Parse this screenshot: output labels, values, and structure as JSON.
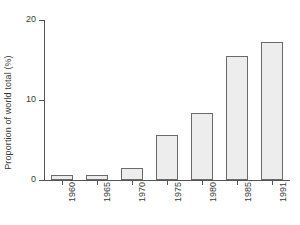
{
  "chart_data": {
    "type": "bar",
    "title": "",
    "subtitle": "",
    "xlabel": "",
    "ylabel": "Proportion of world total (%)",
    "categories": [
      "1960",
      "1965",
      "1970",
      "1975",
      "1980",
      "1985",
      "1991"
    ],
    "values": [
      0.6,
      0.6,
      1.5,
      5.6,
      8.4,
      15.5,
      17.2
    ],
    "ylim": [
      0,
      20
    ],
    "ytick_labels": [
      "0",
      "10",
      "20"
    ],
    "ytick_values": [
      0,
      10,
      20
    ],
    "grid": false,
    "legend": "none",
    "bar_fill_color": "#ededed",
    "bar_border_color": "#6a6a6a",
    "axis_color": "#555555",
    "background_color": "#ffffff",
    "text_color": "#3a3a3a",
    "xtick_label_rotation": 90
  }
}
